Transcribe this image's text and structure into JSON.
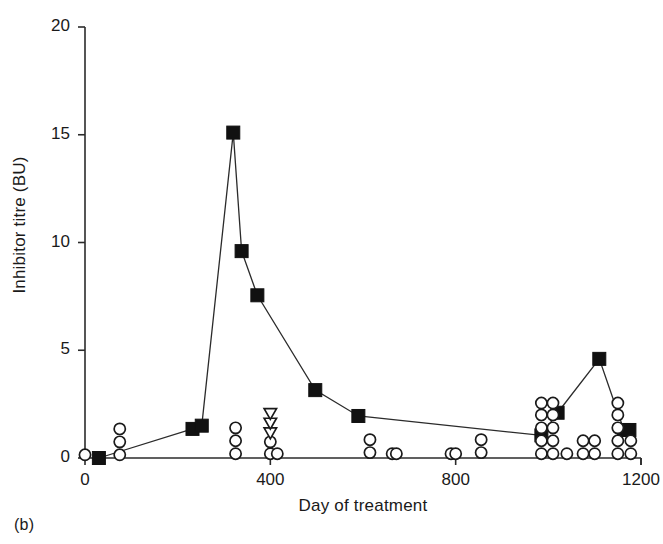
{
  "figure": {
    "panel_caption": "(b)",
    "axis_label_x": "Day of treatment",
    "axis_label_y": "Inhibitor titre (BU)"
  },
  "chart_data": {
    "type": "scatter",
    "title": "",
    "subtitle": "",
    "xlabel": "Day of treatment",
    "ylabel": "Inhibitor titre (BU)",
    "xlim": [
      0,
      1200
    ],
    "ylim": [
      0,
      20
    ],
    "xticks": [
      0,
      400,
      800,
      1200
    ],
    "yticks": [
      0,
      5,
      10,
      15,
      20
    ],
    "xtick_labels": [
      "0",
      "400",
      "800",
      "1200"
    ],
    "ytick_labels": [
      "0",
      "5",
      "10",
      "15",
      "20"
    ],
    "grid": false,
    "legend": "none",
    "series": [
      {
        "name": "Inhibitor titre (filled squares, connected)",
        "marker": "filled-square",
        "connected": true,
        "color": "#111111",
        "points": [
          {
            "x": 30,
            "y": 0.0
          },
          {
            "x": 232,
            "y": 1.35
          },
          {
            "x": 252,
            "y": 1.5
          },
          {
            "x": 320,
            "y": 15.1
          },
          {
            "x": 338,
            "y": 9.6
          },
          {
            "x": 372,
            "y": 7.55
          },
          {
            "x": 497,
            "y": 3.15
          },
          {
            "x": 590,
            "y": 1.95
          },
          {
            "x": 985,
            "y": 1.05
          },
          {
            "x": 1020,
            "y": 2.1
          },
          {
            "x": 1110,
            "y": 4.6
          },
          {
            "x": 1163,
            "y": 1.3
          },
          {
            "x": 1175,
            "y": 1.3
          }
        ]
      },
      {
        "name": "Factor VIII measurements (open circles)",
        "marker": "open-circle",
        "connected": false,
        "color": "#1a1a1a",
        "points": [
          {
            "x": 0,
            "y": 0.15
          },
          {
            "x": 75,
            "y": 0.15
          },
          {
            "x": 75,
            "y": 0.75
          },
          {
            "x": 75,
            "y": 1.35
          },
          {
            "x": 325,
            "y": 0.2
          },
          {
            "x": 325,
            "y": 0.8
          },
          {
            "x": 325,
            "y": 1.4
          },
          {
            "x": 400,
            "y": 0.2
          },
          {
            "x": 400,
            "y": 0.75
          },
          {
            "x": 415,
            "y": 0.2
          },
          {
            "x": 615,
            "y": 0.25
          },
          {
            "x": 615,
            "y": 0.85
          },
          {
            "x": 663,
            "y": 0.2
          },
          {
            "x": 672,
            "y": 0.2
          },
          {
            "x": 790,
            "y": 0.2
          },
          {
            "x": 800,
            "y": 0.2
          },
          {
            "x": 855,
            "y": 0.25
          },
          {
            "x": 855,
            "y": 0.85
          },
          {
            "x": 985,
            "y": 0.2
          },
          {
            "x": 985,
            "y": 0.8
          },
          {
            "x": 985,
            "y": 1.4
          },
          {
            "x": 985,
            "y": 2.0
          },
          {
            "x": 985,
            "y": 2.55
          },
          {
            "x": 1010,
            "y": 0.2
          },
          {
            "x": 1010,
            "y": 0.8
          },
          {
            "x": 1010,
            "y": 1.4
          },
          {
            "x": 1010,
            "y": 2.0
          },
          {
            "x": 1010,
            "y": 2.55
          },
          {
            "x": 1040,
            "y": 0.2
          },
          {
            "x": 1075,
            "y": 0.2
          },
          {
            "x": 1075,
            "y": 0.8
          },
          {
            "x": 1100,
            "y": 0.2
          },
          {
            "x": 1100,
            "y": 0.8
          },
          {
            "x": 1150,
            "y": 0.2
          },
          {
            "x": 1150,
            "y": 0.8
          },
          {
            "x": 1150,
            "y": 1.4
          },
          {
            "x": 1150,
            "y": 2.0
          },
          {
            "x": 1150,
            "y": 2.55
          },
          {
            "x": 1178,
            "y": 0.2
          },
          {
            "x": 1178,
            "y": 0.8
          }
        ]
      },
      {
        "name": "Additional measurements (open down triangles)",
        "marker": "open-triangle-down",
        "connected": false,
        "color": "#1a1a1a",
        "points": [
          {
            "x": 400,
            "y": 1.15
          },
          {
            "x": 400,
            "y": 1.6
          },
          {
            "x": 400,
            "y": 2.05
          }
        ]
      }
    ]
  }
}
